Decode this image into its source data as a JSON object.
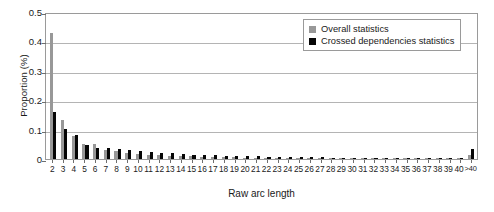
{
  "chart_data": {
    "type": "bar",
    "title": "",
    "subtitle": "",
    "xlabel": "Raw arc length",
    "ylabel": "Proportion (%)",
    "ylim": [
      0,
      0.5
    ],
    "yticks": [
      0.5,
      0.4,
      0.3,
      0.2,
      0.1,
      0
    ],
    "ytick_labels": [
      "0.5",
      "0.4",
      "0.3",
      "0.2",
      "0.1",
      "0"
    ],
    "grid": true,
    "grid_axis": "y",
    "legend_position": "top-right",
    "categories": [
      "2",
      "3",
      "4",
      "5",
      "6",
      "7",
      "8",
      "9",
      "10",
      "11",
      "12",
      "13",
      "14",
      "15",
      "16",
      "17",
      "18",
      "19",
      "20",
      "21",
      "22",
      "23",
      "24",
      "25",
      "26",
      "27",
      "28",
      "29",
      "30",
      "31",
      "32",
      "33",
      "34",
      "35",
      "36",
      "37",
      "38",
      "39",
      "40",
      ">40"
    ],
    "series": [
      {
        "name": "Overall statistics",
        "color": "#989898",
        "values": [
          0.43,
          0.134,
          0.077,
          0.052,
          0.05,
          0.031,
          0.026,
          0.022,
          0.018,
          0.015,
          0.013,
          0.011,
          0.01,
          0.009,
          0.008,
          0.007,
          0.006,
          0.006,
          0.005,
          0.005,
          0.004,
          0.004,
          0.004,
          0.003,
          0.003,
          0.003,
          0.003,
          0.002,
          0.002,
          0.002,
          0.002,
          0.002,
          0.002,
          0.002,
          0.001,
          0.001,
          0.001,
          0.001,
          0.001,
          0.012
        ]
      },
      {
        "name": "Crossed dependencies statistics",
        "color": "#060606",
        "values": [
          0.16,
          0.101,
          0.081,
          0.047,
          0.039,
          0.037,
          0.034,
          0.029,
          0.027,
          0.023,
          0.021,
          0.02,
          0.018,
          0.015,
          0.014,
          0.012,
          0.011,
          0.01,
          0.01,
          0.009,
          0.008,
          0.008,
          0.007,
          0.007,
          0.006,
          0.006,
          0.005,
          0.005,
          0.005,
          0.004,
          0.004,
          0.004,
          0.004,
          0.003,
          0.003,
          0.003,
          0.003,
          0.003,
          0.003,
          0.035
        ]
      }
    ]
  },
  "legend": {
    "items": [
      {
        "label": "Overall statistics",
        "color": "#989898"
      },
      {
        "label": "Crossed dependencies statistics",
        "color": "#060606"
      }
    ]
  },
  "colors": {
    "overall": "#989898",
    "crossed": "#060606",
    "frame": "#9a9a9a",
    "grid": "#b4b4b4",
    "text": "#1a1a1a",
    "background": "#ffffff"
  }
}
